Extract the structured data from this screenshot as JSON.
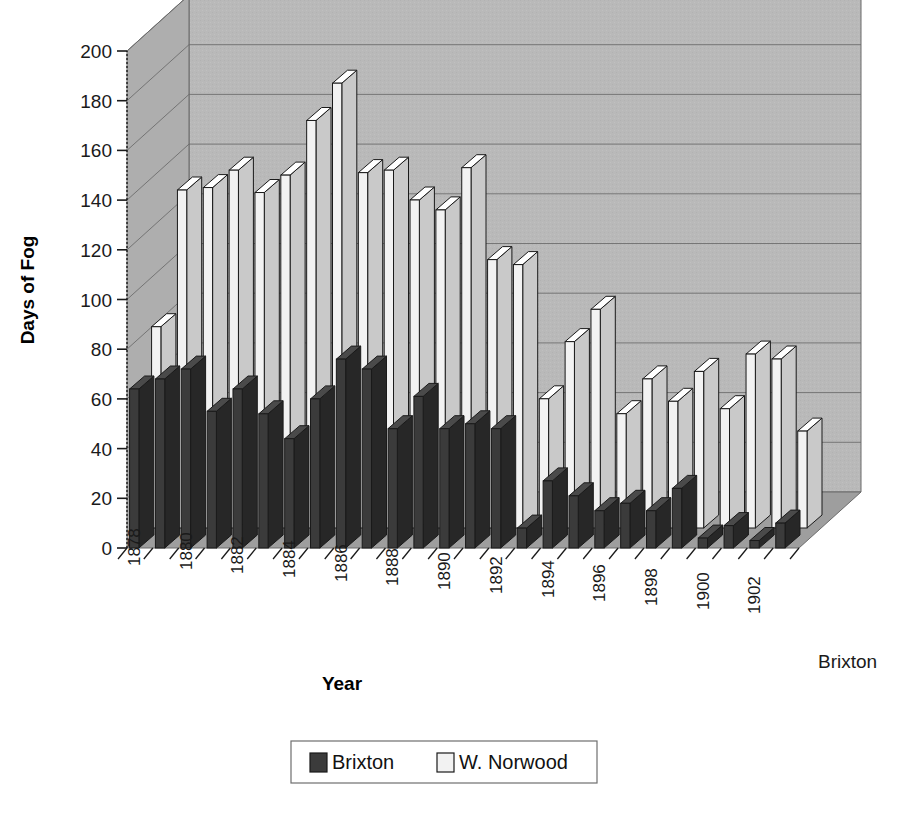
{
  "chart_data": {
    "type": "bar",
    "title": "",
    "subtitle": "",
    "xlabel": "Year",
    "ylabel": "Days of Fog",
    "ylim": [
      0,
      200
    ],
    "ytick_step": 20,
    "yticks": [
      "0",
      "20",
      "40",
      "60",
      "80",
      "100",
      "120",
      "140",
      "160",
      "180",
      "200"
    ],
    "grid": true,
    "legend_position": "bottom",
    "three_d": true,
    "depth_axis_label": "Brixton",
    "categories": [
      "1878",
      "1879",
      "1880",
      "1881",
      "1882",
      "1883",
      "1884",
      "1885",
      "1886",
      "1887",
      "1888",
      "1889",
      "1890",
      "1891",
      "1892",
      "1893",
      "1894",
      "1895",
      "1896",
      "1897",
      "1898",
      "1899",
      "1900",
      "1901",
      "1902",
      "1903"
    ],
    "category_tick_labels": [
      "1878",
      "",
      "1880",
      "",
      "1882",
      "",
      "1884",
      "",
      "1886",
      "",
      "1888",
      "",
      "1890",
      "",
      "1892",
      "",
      "1894",
      "",
      "1896",
      "",
      "1898",
      "",
      "1900",
      "",
      "1902",
      ""
    ],
    "series": [
      {
        "name": "Brixton",
        "color": "#3b3b3b",
        "values": [
          64,
          68,
          72,
          55,
          64,
          54,
          44,
          60,
          76,
          72,
          48,
          61,
          48,
          50,
          48,
          8,
          27,
          21,
          15,
          18,
          15,
          24,
          4,
          9,
          3,
          10
        ]
      },
      {
        "name": "W. Norwood",
        "color": "#f2f2f2",
        "values": [
          81,
          136,
          137,
          144,
          135,
          142,
          164,
          179,
          143,
          144,
          132,
          128,
          145,
          108,
          106,
          52,
          75,
          88,
          46,
          60,
          51,
          63,
          48,
          70,
          68,
          39
        ]
      }
    ],
    "legend": [
      {
        "label": "Brixton",
        "color": "#3b3b3b"
      },
      {
        "label": "W. Norwood",
        "color": "#f2f2f2"
      }
    ],
    "colors": {
      "wall": "#b9b9b9",
      "wall_side": "#aeaeae",
      "floor": "#9e9e9e",
      "gridline": "#6b6b6b",
      "series_brixton": "#3b3b3b",
      "series_norwood": "#f2f2f2",
      "outline": "#1a1a1a",
      "background": "#ffffff"
    }
  }
}
